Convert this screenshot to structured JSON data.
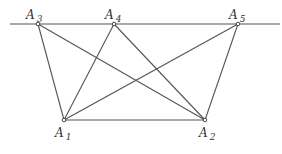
{
  "diagram": {
    "colors": {
      "line": "#555555",
      "point": "#333333",
      "background": "#ffffff"
    },
    "baseline": {
      "x1": 10,
      "y1": 24,
      "x2": 280,
      "y2": 24
    },
    "points": [
      {
        "id": "A1",
        "letter": "A",
        "sub": "1",
        "x": 64,
        "y": 120,
        "lx": 55,
        "ly": 137
      },
      {
        "id": "A2",
        "letter": "A",
        "sub": "2",
        "x": 205,
        "y": 120,
        "lx": 199,
        "ly": 137
      },
      {
        "id": "A3",
        "letter": "A",
        "sub": "3",
        "x": 38,
        "y": 24,
        "lx": 26,
        "ly": 19
      },
      {
        "id": "A4",
        "letter": "A",
        "sub": "4",
        "x": 114,
        "y": 24,
        "lx": 105,
        "ly": 19
      },
      {
        "id": "A5",
        "letter": "A",
        "sub": "5",
        "x": 238,
        "y": 24,
        "lx": 229,
        "ly": 19
      }
    ],
    "segments": [
      [
        "A1",
        "A2"
      ],
      [
        "A1",
        "A3"
      ],
      [
        "A1",
        "A4"
      ],
      [
        "A1",
        "A5"
      ],
      [
        "A2",
        "A3"
      ],
      [
        "A2",
        "A4"
      ],
      [
        "A2",
        "A5"
      ]
    ]
  }
}
